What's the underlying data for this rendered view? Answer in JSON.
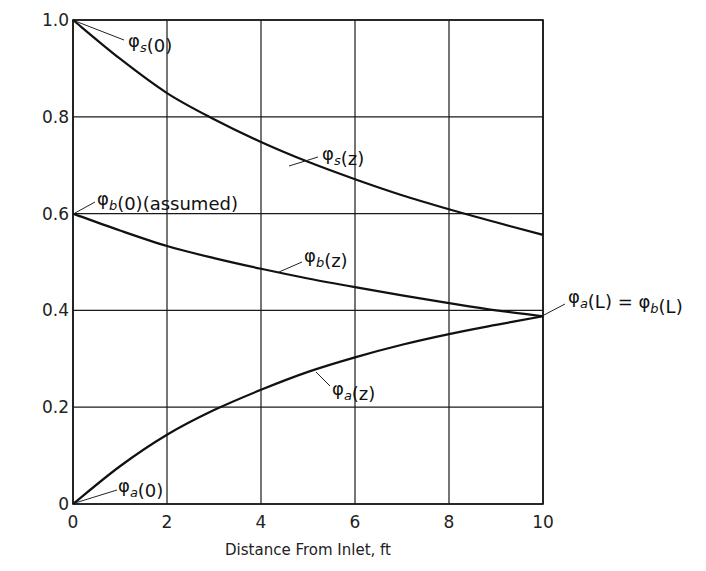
{
  "chart_data": {
    "type": "line",
    "title": "",
    "xlabel": "Distance From Inlet, ft",
    "ylabel": "",
    "xlim": [
      0,
      10
    ],
    "ylim": [
      0,
      1.0
    ],
    "grid": true,
    "legend": "none (curves labeled directly)",
    "x_ticks": [
      "0",
      "2",
      "4",
      "6",
      "8",
      "10"
    ],
    "y_ticks": [
      "0",
      "0.2",
      "0.4",
      "0.6",
      "0.8",
      "1.0"
    ],
    "x": [
      0,
      1,
      2,
      3,
      4,
      5,
      6,
      7,
      8,
      9,
      10
    ],
    "series": [
      {
        "name": "φs(z)",
        "values": [
          1.0,
          0.92,
          0.849,
          0.795,
          0.748,
          0.707,
          0.671,
          0.638,
          0.609,
          0.582,
          0.556
        ]
      },
      {
        "name": "φb(z)",
        "values": [
          0.6,
          0.565,
          0.533,
          0.508,
          0.486,
          0.466,
          0.448,
          0.431,
          0.415,
          0.4,
          0.388
        ]
      },
      {
        "name": "φa(z)",
        "values": [
          0.0,
          0.078,
          0.143,
          0.194,
          0.236,
          0.273,
          0.303,
          0.329,
          0.351,
          0.37,
          0.388
        ]
      }
    ],
    "annotations": [
      {
        "text": "φs(0)",
        "points_to": [
          0,
          1.0
        ]
      },
      {
        "text": "φs(z)",
        "points_to": [
          4.6,
          0.725
        ]
      },
      {
        "text": "φb(0)(assumed)",
        "points_to": [
          0,
          0.6
        ]
      },
      {
        "text": "φb(z)",
        "points_to": [
          4.4,
          0.478
        ]
      },
      {
        "text": "φa(L) = φb(L)",
        "points_to": [
          10,
          0.388
        ]
      },
      {
        "text": "φa(z)",
        "points_to": [
          5.0,
          0.285
        ]
      },
      {
        "text": "φa(0)",
        "points_to": [
          0,
          0.0
        ]
      }
    ]
  },
  "labels": {
    "xlabel": "Distance From Inlet, ft",
    "x_ticks": [
      "0",
      "2",
      "4",
      "6",
      "8",
      "10"
    ],
    "y_ticks": [
      "0",
      "0.2",
      "0.4",
      "0.6",
      "0.8",
      "1.0"
    ]
  }
}
